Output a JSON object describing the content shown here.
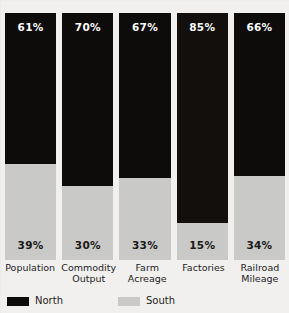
{
  "chart_data": {
    "type": "bar",
    "variant": "stacked-100-percent",
    "title": "",
    "title_note": "cropped off top edge of scan, illegible",
    "xlabel": "",
    "ylabel": "",
    "ylim": [
      0,
      100
    ],
    "grid": false,
    "legend_position": "bottom-left",
    "categories": [
      "Population",
      "Commodity Output",
      "Farm Acreage",
      "Factories",
      "Railroad Mileage"
    ],
    "series": [
      {
        "name": "North",
        "color": "#0d0c0b",
        "values": [
          61,
          70,
          67,
          85,
          66
        ]
      },
      {
        "name": "South",
        "color": "#c9c9c7",
        "values": [
          39,
          30,
          33,
          15,
          34
        ]
      }
    ],
    "value_labels": {
      "north": [
        "61%",
        "70%",
        "67%",
        "85%",
        "66%"
      ],
      "south": [
        "39%",
        "30%",
        "33%",
        "15%",
        "34%"
      ]
    }
  },
  "categories_display": [
    {
      "line1": "Population",
      "line2": ""
    },
    {
      "line1": "Commodity",
      "line2": "Output"
    },
    {
      "line1": "Farm",
      "line2": "Acreage"
    },
    {
      "line1": "Factories",
      "line2": ""
    },
    {
      "line1": "Railroad",
      "line2": "Mileage"
    }
  ],
  "legend": {
    "north_label": "North",
    "south_label": "South"
  },
  "colors": {
    "north": "#0d0c0b",
    "south": "#c9c9c7",
    "background": "#f1f0ee",
    "text": "#1e1d1a"
  }
}
